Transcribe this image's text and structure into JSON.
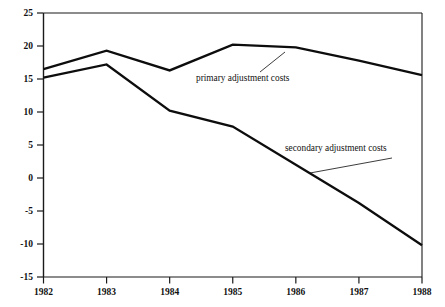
{
  "chart_data": {
    "type": "line",
    "title": "",
    "subtitle": "",
    "xlabel": "",
    "ylabel": "",
    "x": [
      1982,
      1983,
      1984,
      1985,
      1986,
      1987,
      1988
    ],
    "categories": [
      "1982",
      "1983",
      "1984",
      "1985",
      "1986",
      "1987",
      "1988"
    ],
    "xlim": [
      1982,
      1988
    ],
    "ylim": [
      -15,
      25
    ],
    "ytick_values": [
      25,
      20,
      15,
      10,
      5,
      0,
      -5,
      -10,
      -15
    ],
    "ytick_labels": [
      "25",
      "20",
      "15",
      "10",
      "5",
      "0",
      "-5",
      "-10",
      "-15"
    ],
    "xtick_labels": [
      "1982",
      "1983",
      "1984",
      "1985",
      "1986",
      "1987",
      "1988"
    ],
    "grid": false,
    "legend_position": "inline-annotations",
    "series": [
      {
        "name": "primary adjustment costs",
        "values": [
          16.5,
          19.3,
          16.3,
          20.2,
          19.8,
          17.8,
          15.6
        ]
      },
      {
        "name": "secondary adjustment costs",
        "values": [
          15.2,
          17.2,
          10.2,
          7.8,
          2.0,
          -3.8,
          -10.2
        ]
      }
    ],
    "annotations": [
      {
        "text": "primary adjustment costs",
        "series": "primary adjustment costs",
        "text_x": 196,
        "text_y": 81,
        "leader_from_x": 260,
        "leader_from_y": 72,
        "leader_to_x": 285,
        "leader_to_y": 52
      },
      {
        "text": "secondary adjustment costs",
        "series": "secondary adjustment costs",
        "text_x": 285,
        "text_y": 151,
        "leader_from_x": 310,
        "leader_from_y": 173,
        "leader_to_x": 392,
        "leader_to_y": 158
      }
    ],
    "colors": {
      "line": "#0d0d0d",
      "axis": "#1a1a1a",
      "background": "#ffffff",
      "text": "#111111"
    }
  }
}
